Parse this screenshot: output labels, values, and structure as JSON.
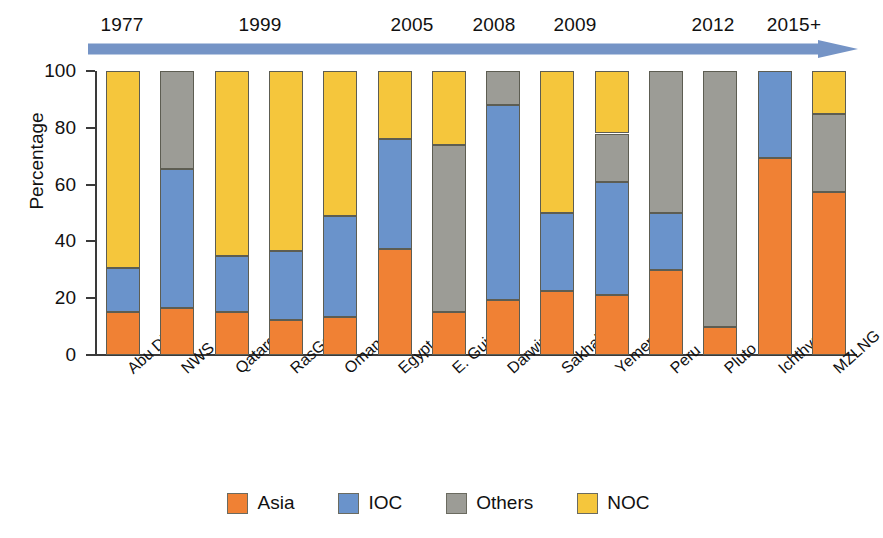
{
  "chart_data": {
    "type": "bar",
    "subtype": "stacked-percentage",
    "title": "",
    "xlabel": "",
    "ylabel": "Percentage",
    "ylim": [
      0,
      100
    ],
    "yticks": [
      0,
      20,
      40,
      60,
      80,
      100
    ],
    "grid": false,
    "legend_position": "bottom",
    "categories": [
      "Abu Dhabi",
      "NWS",
      "Qatargas 1",
      "RasGas 1",
      "Oman LNG",
      "Egypt",
      "E. Guinea",
      "Darwin",
      "Sakhalin",
      "Yemen",
      "Peru",
      "Pluto",
      "Ichthys",
      "MZLNG"
    ],
    "series": [
      {
        "name": "Asia",
        "color": "#F08134",
        "values": [
          15,
          16.5,
          15,
          12.5,
          13.5,
          37.5,
          15,
          19.5,
          22.5,
          21,
          30,
          10,
          69.5,
          57.5
        ]
      },
      {
        "name": "IOC",
        "color": "#6A93CB",
        "values": [
          15.5,
          49,
          20,
          24,
          35.5,
          38.5,
          0,
          68.5,
          27.5,
          40,
          20,
          0,
          30.5,
          0
        ]
      },
      {
        "name": "Others",
        "color": "#9C9C96",
        "values": [
          0,
          34.5,
          0,
          0,
          0,
          0,
          59,
          12,
          0,
          17,
          50,
          90,
          0,
          27.5
        ]
      },
      {
        "name": "NOC",
        "color": "#F5C63C",
        "values": [
          69.5,
          0,
          65,
          63.5,
          51,
          24,
          26,
          0,
          50,
          22,
          0,
          0,
          0,
          15
        ]
      }
    ],
    "timeline": {
      "years": [
        "1977",
        "1999",
        "2005",
        "2008",
        "2009",
        "2012",
        "2015+"
      ],
      "year_positions_px": [
        122,
        260,
        412,
        494,
        575,
        713,
        794
      ],
      "arrow_color": "#7594C6"
    },
    "legend": [
      {
        "label": "Asia",
        "color": "#F08134"
      },
      {
        "label": "IOC",
        "color": "#6A93CB"
      },
      {
        "label": "Others",
        "color": "#9C9C96"
      },
      {
        "label": "NOC",
        "color": "#F5C63C"
      }
    ]
  }
}
